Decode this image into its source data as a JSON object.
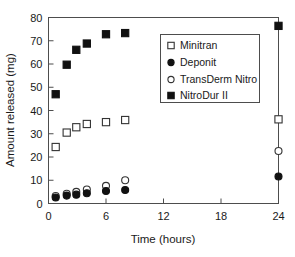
{
  "chart_data": {
    "type": "scatter",
    "title": "",
    "xlabel": "Time (hours)",
    "ylabel": "Amount released (mg)",
    "xlim": [
      0,
      24
    ],
    "ylim": [
      0,
      80
    ],
    "xticks": [
      0,
      6,
      12,
      18,
      24
    ],
    "yticks": [
      0,
      10,
      20,
      30,
      40,
      50,
      60,
      70,
      80
    ],
    "xtick_labels": [
      "0",
      "6",
      "12",
      "18",
      "24"
    ],
    "ytick_labels": [
      "0",
      "10",
      "20",
      "30",
      "40",
      "50",
      "60",
      "70",
      "80"
    ],
    "grid": false,
    "legend_position": "upper right",
    "series": [
      {
        "name": "Minitran",
        "marker": "open-square",
        "color": "#333333",
        "fill": "#ffffff",
        "points": [
          {
            "x": 0.75,
            "y": 24.3
          },
          {
            "x": 1.9,
            "y": 30.5
          },
          {
            "x": 2.9,
            "y": 32.8
          },
          {
            "x": 4.0,
            "y": 34.2
          },
          {
            "x": 6.0,
            "y": 35.0
          },
          {
            "x": 8.0,
            "y": 35.9
          },
          {
            "x": 24.0,
            "y": 36.2
          }
        ]
      },
      {
        "name": "Deponit",
        "marker": "filled-circle",
        "color": "#111111",
        "fill": "#111111",
        "points": [
          {
            "x": 0.75,
            "y": 2.6
          },
          {
            "x": 1.9,
            "y": 3.4
          },
          {
            "x": 2.9,
            "y": 3.8
          },
          {
            "x": 4.0,
            "y": 4.4
          },
          {
            "x": 6.0,
            "y": 5.4
          },
          {
            "x": 8.0,
            "y": 5.8
          },
          {
            "x": 24.0,
            "y": 11.6
          }
        ]
      },
      {
        "name": "TransDerm Nitro",
        "marker": "open-circle",
        "color": "#333333",
        "fill": "#ffffff",
        "points": [
          {
            "x": 0.75,
            "y": 3.2
          },
          {
            "x": 1.9,
            "y": 4.2
          },
          {
            "x": 2.9,
            "y": 5.0
          },
          {
            "x": 4.0,
            "y": 6.0
          },
          {
            "x": 6.0,
            "y": 7.6
          },
          {
            "x": 8.0,
            "y": 10.0
          },
          {
            "x": 24.0,
            "y": 22.6
          }
        ]
      },
      {
        "name": "NitroDur II",
        "marker": "filled-square",
        "color": "#111111",
        "fill": "#111111",
        "points": [
          {
            "x": 0.75,
            "y": 47.0
          },
          {
            "x": 1.9,
            "y": 59.7
          },
          {
            "x": 2.9,
            "y": 66.1
          },
          {
            "x": 4.0,
            "y": 68.8
          },
          {
            "x": 6.0,
            "y": 72.8
          },
          {
            "x": 8.0,
            "y": 73.3
          },
          {
            "x": 24.0,
            "y": 76.4
          }
        ]
      }
    ]
  },
  "legend": {
    "entries": [
      {
        "label": "Minitran"
      },
      {
        "label": "Deponit"
      },
      {
        "label": "TransDerm Nitro"
      },
      {
        "label": "NitroDur II"
      }
    ]
  },
  "axes": {
    "x_title": "Time (hours)",
    "y_title": "Amount released (mg)"
  },
  "colors": {
    "frame": "#4d4d4d",
    "text": "#1a1a1a",
    "marker_dark": "#111111",
    "marker_open_stroke": "#333333",
    "background": "#ffffff"
  }
}
